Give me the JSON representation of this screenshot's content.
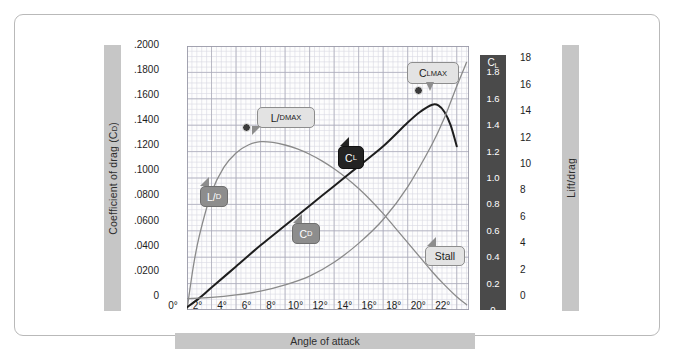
{
  "chart_data": {
    "type": "line",
    "title": "",
    "xlabel": "Angle of attack",
    "ylabel_left": "Coefficient of drag (CD)",
    "ylabel_right": "Lift/drag",
    "ylabel_inner": "CL",
    "grid": true,
    "legend": "inline-callouts",
    "xlim": [
      0,
      23
    ],
    "xticks": [
      "0°",
      "2°",
      "4°",
      "6°",
      "8°",
      "10°",
      "12°",
      "14°",
      "16°",
      "18°",
      "20°",
      "22°"
    ],
    "xtick_values": [
      0,
      2,
      4,
      6,
      8,
      10,
      12,
      14,
      16,
      18,
      20,
      22
    ],
    "yticks_left": [
      ".2000",
      ".1800",
      ".1600",
      ".1400",
      ".1200",
      ".1000",
      ".0800",
      ".0600",
      ".0400",
      ".0200",
      "0"
    ],
    "ytick_values_left": [
      0.2,
      0.18,
      0.16,
      0.14,
      0.12,
      0.1,
      0.08,
      0.06,
      0.04,
      0.02,
      0
    ],
    "ylim_left": [
      0,
      0.21
    ],
    "yticks_right": [
      "18",
      "16",
      "14",
      "12",
      "10",
      "8",
      "6",
      "4",
      "2",
      "0"
    ],
    "ytick_values_right": [
      18,
      16,
      14,
      12,
      10,
      8,
      6,
      4,
      2,
      0
    ],
    "ylim_right": [
      0,
      20
    ],
    "yticks_cl": [
      "1.8",
      "1.6",
      "1.4",
      "1.2",
      "1.0",
      "0.8",
      "0.6",
      "0.4",
      "0.2",
      "0"
    ],
    "ytick_values_cl": [
      1.8,
      1.6,
      1.4,
      1.2,
      1.0,
      0.8,
      0.6,
      0.4,
      0.2,
      0
    ],
    "ylim_cl": [
      0,
      2.0
    ],
    "series": [
      {
        "name": "L/D",
        "axis": "right",
        "color": "#8a8a8a",
        "x": [
          0,
          0.5,
          1,
          2,
          3,
          4,
          5,
          6,
          7,
          8,
          9,
          10,
          11,
          12,
          13,
          14,
          15,
          16,
          17,
          18,
          19,
          20,
          21,
          22,
          22.8
        ],
        "values": [
          0.0,
          3.2,
          5.6,
          8.9,
          10.8,
          11.9,
          12.5,
          12.75,
          12.7,
          12.5,
          12.2,
          11.8,
          11.3,
          10.7,
          10.0,
          9.2,
          8.3,
          7.3,
          6.2,
          5.1,
          4.0,
          2.9,
          1.9,
          1.0,
          0.4
        ]
      },
      {
        "name": "CL",
        "axis": "cl",
        "color": "#1e1e1e",
        "x": [
          0,
          1,
          2,
          4,
          6,
          8,
          10,
          12,
          14,
          16,
          18,
          19,
          20,
          20.5,
          21,
          21.5,
          22
        ],
        "values": [
          0.02,
          0.09,
          0.17,
          0.33,
          0.49,
          0.64,
          0.79,
          0.94,
          1.09,
          1.24,
          1.42,
          1.5,
          1.555,
          1.55,
          1.5,
          1.4,
          1.24
        ]
      },
      {
        "name": "CD",
        "axis": "left",
        "color": "#8a8a8a",
        "x": [
          0,
          2,
          4,
          6,
          8,
          10,
          12,
          14,
          16,
          18,
          20,
          21,
          22,
          22.8
        ],
        "values": [
          0.009,
          0.01,
          0.012,
          0.015,
          0.02,
          0.027,
          0.038,
          0.053,
          0.072,
          0.098,
          0.132,
          0.153,
          0.178,
          0.197
        ]
      }
    ],
    "markers": [
      {
        "name": "L/D MAX",
        "x": 6.0,
        "axis": "right",
        "value": 12.75
      },
      {
        "name": "CL MAX",
        "x": 20.0,
        "axis": "cl",
        "value": 1.555
      }
    ]
  },
  "axes": {
    "left_title": "Coefficient of drag (C",
    "left_title_sub": "D",
    "left_title_close": ")",
    "right_title": "Lift/drag",
    "x_title": "Angle of attack",
    "cl_head": "C",
    "cl_head_sub": "L"
  },
  "callouts": {
    "ld_max": {
      "main": "L/",
      "sub1": "D",
      "sub2": "MAX"
    },
    "cl_max": {
      "main": "C",
      "sub1": "L",
      "sub2": "MAX"
    },
    "ld": {
      "main": "L/",
      "sub1": "D"
    },
    "cd": {
      "main": "C",
      "sub1": "D"
    },
    "cl": {
      "main": "C",
      "sub1": "L"
    },
    "stall": {
      "main": "Stall"
    }
  },
  "colors": {
    "frame_border": "#b9b9b9",
    "bar_gray": "#c6c6c6",
    "cl_bar_dark": "#4a4a4a",
    "curve_gray": "#8a8a8a",
    "curve_black": "#1e1e1e",
    "grid_minor": "#d8d8e2",
    "grid_major": "#a9a9b8"
  }
}
